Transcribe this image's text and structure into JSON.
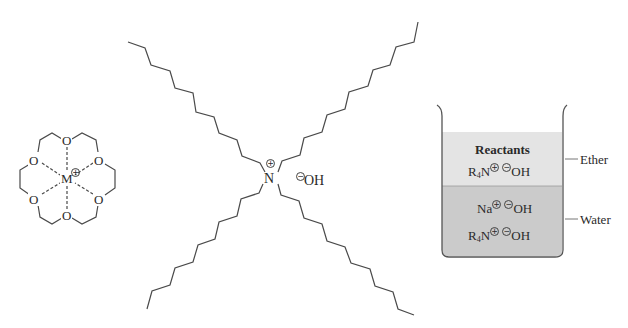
{
  "figure": {
    "crown_ether": {
      "metal_label": "M",
      "metal_charge": "+",
      "oxygen_label": "O",
      "oxygen_count": 6
    },
    "quaternary_ammonium": {
      "central_atom": "N",
      "central_charge": "+",
      "counterion": "OH",
      "counterion_charge": "−",
      "alkyl_chains": 4
    },
    "beaker": {
      "ether_layer": {
        "title": "Reactants",
        "species": [
          {
            "cation": "R",
            "subscript": "4",
            "cation_tail": "N",
            "cation_charge": "+",
            "anion": "OH",
            "anion_charge": "−"
          }
        ],
        "side_label": "Ether",
        "color": "#e4e4e4"
      },
      "water_layer": {
        "species": [
          {
            "cation": "Na",
            "subscript": "",
            "cation_tail": "",
            "cation_charge": "+",
            "anion": "OH",
            "anion_charge": "−"
          },
          {
            "cation": "R",
            "subscript": "4",
            "cation_tail": "N",
            "cation_charge": "+",
            "anion": "OH",
            "anion_charge": "−"
          }
        ],
        "side_label": "Water",
        "color": "#cbcbcb"
      },
      "wall_color": "#555555"
    },
    "line_color": "#4a4a4a"
  }
}
